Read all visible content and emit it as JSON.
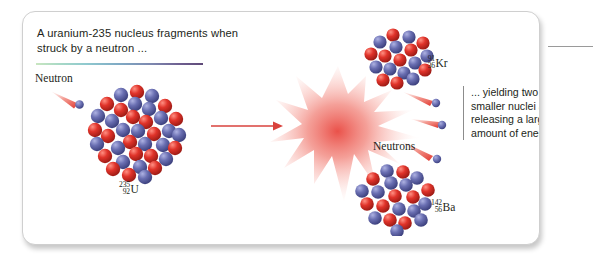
{
  "figure": {
    "headline": "A uranium-235 nucleus fragments when struck by a neutron ...",
    "caption": "... yielding two smaller nuclei and releasing a large amount of energy.",
    "labels": {
      "neutron": "Neutron",
      "neutrons": "Neutrons"
    },
    "nuclides": {
      "uranium": {
        "mass": "235",
        "atomic": "92",
        "symbol": "U"
      },
      "krypton": {
        "mass": "91",
        "atomic": "36",
        "symbol": "Kr"
      },
      "barium": {
        "mass": "142",
        "atomic": "56",
        "symbol": "Ba"
      }
    },
    "colors": {
      "proton_red": "#e0332a",
      "neutron_blue": "#6a6fb2",
      "arrow_red": "#d9423c",
      "burst_red": "#e8423a",
      "rule_start": "#c9e6c0",
      "rule_end": "#5f4a78",
      "card_border": "#cfcfcf",
      "text": "#231f20"
    }
  }
}
